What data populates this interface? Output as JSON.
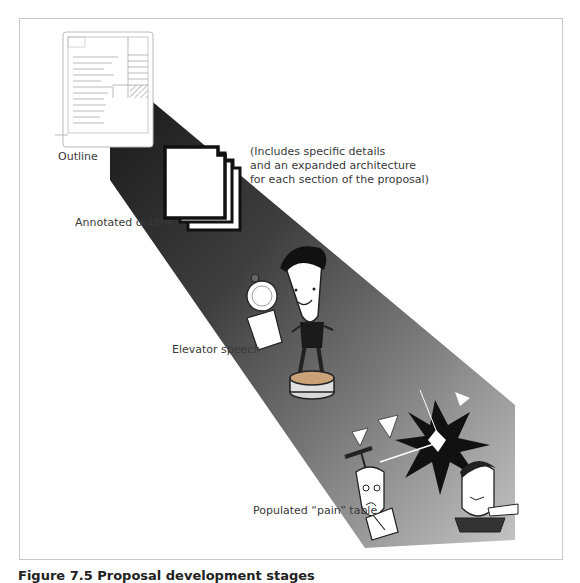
{
  "figure": {
    "stages": [
      {
        "id": "outline",
        "label": "Outline"
      },
      {
        "id": "annotated-outline",
        "label": "Annotated outline",
        "note_lines": [
          "(Includes specific details",
          "and an expanded architecture",
          "for each section of the proposal)"
        ]
      },
      {
        "id": "elevator-speech",
        "label": "Elevator speech"
      },
      {
        "id": "pain-table",
        "label": "Populated “pain” table"
      }
    ],
    "caption": "Figure 7.5  Proposal development stages",
    "colors": {
      "beam_start": "#1e1e1e",
      "beam_mid": "#5a5a5a",
      "beam_end": "#b8b8b8",
      "frame_border": "#c8c8c8",
      "label_text": "#3a3a3a"
    }
  }
}
